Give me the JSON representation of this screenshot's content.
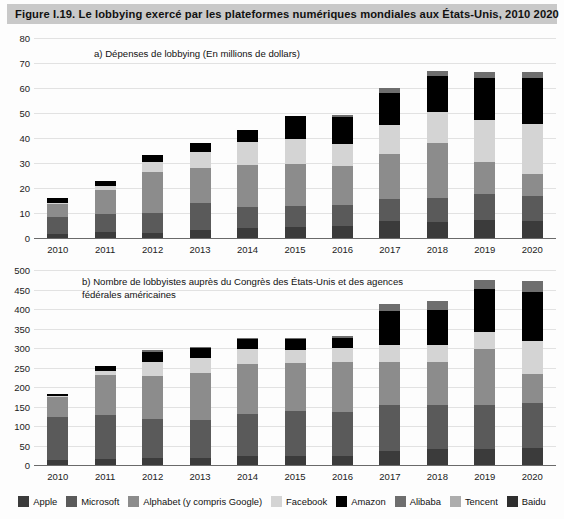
{
  "figure": {
    "title": "Figure I.19.  Le lobbying exercé par les plateformes numériques mondiales aux États-Unis, 2010 2020"
  },
  "legend": {
    "items": [
      {
        "label": "Apple",
        "color": "#3b3b3b"
      },
      {
        "label": "Microsoft",
        "color": "#5a5a5a"
      },
      {
        "label": "Alphabet (y compris Google)",
        "color": "#8c8c8c"
      },
      {
        "label": "Facebook",
        "color": "#d4d4d4"
      },
      {
        "label": "Amazon",
        "color": "#000000"
      },
      {
        "label": "Alibaba",
        "color": "#6e6e6e"
      },
      {
        "label": "Tencent",
        "color": "#adadad"
      },
      {
        "label": "Baidu",
        "color": "#2e2e2e"
      }
    ]
  },
  "chart_data": [
    {
      "id": "panel-a",
      "type": "bar",
      "stacked": true,
      "title": "a) Dépenses de lobbying (En millions de dollars)",
      "xlabel": "",
      "ylabel": "",
      "ylim": [
        0,
        80
      ],
      "yticks": [
        0,
        10,
        20,
        30,
        40,
        50,
        60,
        70,
        80
      ],
      "grid": true,
      "legend_position": "bottom",
      "categories": [
        "2010",
        "2011",
        "2012",
        "2013",
        "2014",
        "2015",
        "2016",
        "2017",
        "2018",
        "2019",
        "2020"
      ],
      "series": [
        {
          "name": "Apple",
          "values": [
            1.6,
            2.3,
            2.0,
            3.4,
            4.1,
            4.5,
            4.7,
            7.0,
            6.6,
            7.4,
            6.7
          ]
        },
        {
          "name": "Microsoft",
          "values": [
            6.9,
            7.3,
            8.1,
            10.5,
            8.3,
            8.5,
            8.7,
            8.5,
            9.6,
            10.3,
            10.2
          ]
        },
        {
          "name": "Alphabet (y compris Google)",
          "values": [
            5.2,
            9.7,
            16.5,
            14.1,
            16.8,
            16.7,
            15.4,
            18.1,
            21.7,
            12.8,
            8.9
          ]
        },
        {
          "name": "Facebook",
          "values": [
            0.4,
            1.4,
            4.0,
            6.4,
            9.3,
            9.9,
            8.7,
            11.5,
            12.6,
            16.7,
            19.7
          ]
        },
        {
          "name": "Amazon",
          "values": [
            1.8,
            2.2,
            2.5,
            3.5,
            4.7,
            9.1,
            11.0,
            13.0,
            14.2,
            16.8,
            18.7
          ]
        },
        {
          "name": "Alibaba",
          "values": [
            0.0,
            0.0,
            0.0,
            0.1,
            0.2,
            0.2,
            0.6,
            1.8,
            2.3,
            2.3,
            2.2
          ]
        },
        {
          "name": "Tencent",
          "values": [
            0.0,
            0.0,
            0.0,
            0.0,
            0.0,
            0.0,
            0.0,
            0.0,
            0.0,
            0.0,
            0.0
          ]
        },
        {
          "name": "Baidu",
          "values": [
            0.0,
            0.0,
            0.0,
            0.0,
            0.0,
            0.0,
            0.0,
            0.0,
            0.0,
            0.0,
            0.0
          ]
        }
      ],
      "totals": [
        15.9,
        22.9,
        33.1,
        38.0,
        43.4,
        48.9,
        49.1,
        59.9,
        67.0,
        66.3,
        66.4
      ]
    },
    {
      "id": "panel-b",
      "type": "bar",
      "stacked": true,
      "title": "b) Nombre de lobbyistes auprès du Congrès des États-Unis et des agences\n    fédérales américaines",
      "xlabel": "",
      "ylabel": "",
      "ylim": [
        0,
        500
      ],
      "yticks": [
        0,
        50,
        100,
        150,
        200,
        250,
        300,
        350,
        400,
        450,
        500
      ],
      "grid": true,
      "legend_position": "bottom",
      "categories": [
        "2010",
        "2011",
        "2012",
        "2013",
        "2014",
        "2015",
        "2016",
        "2017",
        "2018",
        "2019",
        "2020"
      ],
      "series": [
        {
          "name": "Apple",
          "values": [
            13,
            15,
            17,
            19,
            22,
            24,
            24,
            37,
            42,
            41,
            43
          ]
        },
        {
          "name": "Microsoft",
          "values": [
            110,
            112,
            100,
            96,
            110,
            114,
            113,
            116,
            113,
            112,
            117
          ]
        },
        {
          "name": "Alphabet (y compris Google)",
          "values": [
            52,
            103,
            112,
            120,
            126,
            123,
            126,
            111,
            109,
            144,
            73
          ]
        },
        {
          "name": "Facebook",
          "values": [
            2,
            10,
            36,
            40,
            39,
            35,
            38,
            44,
            45,
            45,
            85
          ]
        },
        {
          "name": "Amazon",
          "values": [
            6,
            13,
            25,
            25,
            25,
            26,
            26,
            88,
            89,
            110,
            126
          ]
        },
        {
          "name": "Alibaba",
          "values": [
            0,
            0,
            5,
            3,
            3,
            3,
            4,
            18,
            22,
            22,
            27
          ]
        },
        {
          "name": "Tencent",
          "values": [
            0,
            0,
            0,
            0,
            0,
            0,
            0,
            0,
            0,
            0,
            0
          ]
        },
        {
          "name": "Baidu",
          "values": [
            0,
            0,
            0,
            0,
            0,
            0,
            0,
            0,
            0,
            0,
            0
          ]
        }
      ],
      "totals": [
        183,
        253,
        295,
        303,
        325,
        325,
        331,
        414,
        420,
        474,
        471
      ]
    }
  ]
}
